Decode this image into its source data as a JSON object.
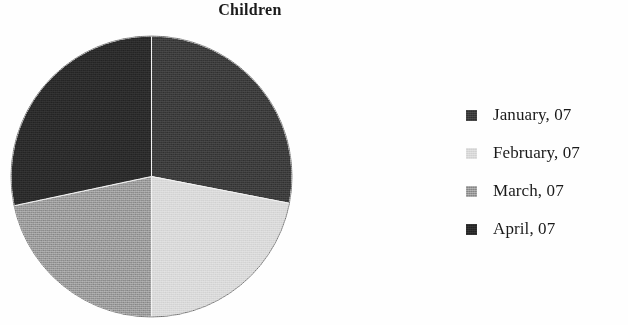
{
  "chart_data": {
    "type": "pie",
    "title": "Children",
    "xlabel": "",
    "ylabel": "",
    "legend_position": "right",
    "grid": false,
    "categories": [
      "January, 07",
      "February, 07",
      "March, 07",
      "April, 07"
    ],
    "values": [
      28,
      22,
      22,
      28
    ],
    "units": "percent",
    "slice_colors": [
      "#3c3c3c",
      "#d9d9d9",
      "#9a9a9a",
      "#2b2b2b"
    ],
    "slices": [
      {
        "label": "January, 07",
        "value": 28,
        "start_angle_deg": 0,
        "end_angle_deg": 101,
        "color": "#3c3c3c"
      },
      {
        "label": "February, 07",
        "value": 22,
        "start_angle_deg": 101,
        "end_angle_deg": 180,
        "color": "#d9d9d9"
      },
      {
        "label": "March, 07",
        "value": 22,
        "start_angle_deg": 180,
        "end_angle_deg": 258,
        "color": "#9a9a9a"
      },
      {
        "label": "April, 07",
        "value": 28,
        "start_angle_deg": 258,
        "end_angle_deg": 360,
        "color": "#2b2b2b"
      }
    ]
  },
  "title": {
    "text": "Children"
  },
  "legend": {
    "items": [
      {
        "label": "January, 07",
        "color": "#3c3c3c"
      },
      {
        "label": "February, 07",
        "color": "#d9d9d9"
      },
      {
        "label": "March, 07",
        "color": "#9a9a9a"
      },
      {
        "label": "April, 07",
        "color": "#2b2b2b"
      }
    ]
  },
  "colors": {
    "background": "#ffffff",
    "text": "#1a1a1a",
    "slice_january": "#3c3c3c",
    "slice_february": "#d9d9d9",
    "slice_march": "#9a9a9a",
    "slice_april": "#2b2b2b"
  }
}
